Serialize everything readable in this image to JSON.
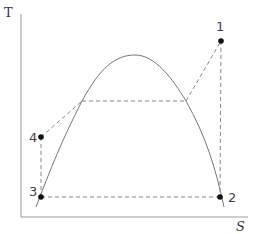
{
  "diagram": {
    "type": "T-S diagram (thermodynamic cycle)",
    "axes": {
      "y_label": "T",
      "x_label": "S"
    },
    "points": [
      {
        "id": "1",
        "label": "1",
        "x": 221,
        "y": 41
      },
      {
        "id": "2",
        "label": "2",
        "x": 220,
        "y": 197
      },
      {
        "id": "3",
        "label": "3",
        "x": 41,
        "y": 197
      },
      {
        "id": "4",
        "label": "4",
        "x": 41,
        "y": 137
      }
    ],
    "colors": {
      "axis": "#9a9a9a",
      "curve": "#777777",
      "dashed": "#888888",
      "point": "#111111"
    }
  }
}
